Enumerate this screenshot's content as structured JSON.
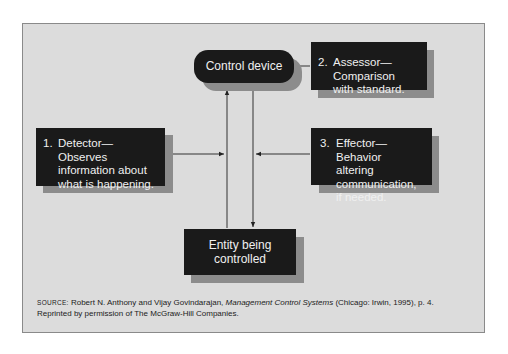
{
  "diagram": {
    "control_device": "Control device",
    "assessor": {
      "number": "2.",
      "text_line1": "Assessor—Comparison",
      "text_line2": "with standard."
    },
    "detector": {
      "number": "1.",
      "text_line1": "Detector—Observes",
      "text_line2": "information about",
      "text_line3": "what is happening."
    },
    "effector": {
      "number": "3.",
      "text_line1": "Effector—Behavior",
      "text_line2": "altering communication,",
      "text_line3": "if needed."
    },
    "entity": {
      "line1": "Entity being",
      "line2": "controlled"
    }
  },
  "source": {
    "label": "Source:",
    "text_before_title": " Robert N. Anthony and Vijay Govindarajan, ",
    "title": "Management Control Systems",
    "text_after_title": " (Chicago: Irwin, 1995), p. 4.",
    "line2": "Reprinted by permission of The McGraw-Hill Companies."
  },
  "colors": {
    "panel_bg": "#dcdcdc",
    "box_bg": "#1a1a1a",
    "shadow": "#8c8c8c",
    "box_text": "#f0f0f0"
  }
}
